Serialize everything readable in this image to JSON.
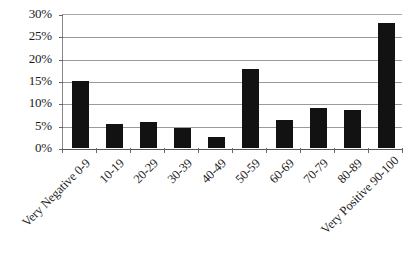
{
  "chart_data": {
    "type": "bar",
    "title": "",
    "subtitle": "",
    "xlabel": "",
    "ylabel": "",
    "categories": [
      "Very Negative 0-9",
      "10-19",
      "20-29",
      "30-39",
      "40-49",
      "50-59",
      "60-69",
      "70-79",
      "80-89",
      "Very Positive 90-100"
    ],
    "values": [
      15,
      5.4,
      5.9,
      4.5,
      2.5,
      17.8,
      6.3,
      9,
      8.4,
      28
    ],
    "ylim": [
      0,
      30
    ],
    "ytick_values": [
      0,
      5,
      10,
      15,
      20,
      25,
      30
    ],
    "ytick_labels": [
      "0%",
      "5%",
      "10%",
      "15%",
      "20%",
      "25%",
      "30%"
    ],
    "grid": true,
    "legend": false,
    "legend_position": "none",
    "bar_color": "#121212",
    "gridline_color": "#9a9a9a",
    "axis_color": "#555555",
    "background_color": "#ffffff"
  }
}
